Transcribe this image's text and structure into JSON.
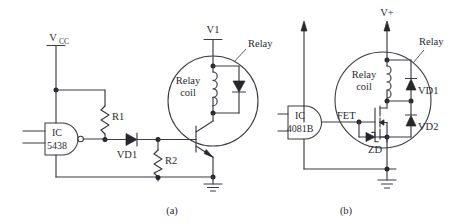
{
  "figure": {
    "background_color": "#ffffff",
    "line_color": "#3b3b42",
    "text_color": "#2a2a30"
  },
  "panels": [
    {
      "id": "a",
      "caption": "(a)",
      "supply_left": {
        "label_main": "V",
        "label_sub": "CC",
        "terminal_style": "bar"
      },
      "supply_right": {
        "label": "V1",
        "terminal_style": "bar"
      },
      "ic": {
        "name": "IC",
        "part": "5438",
        "gate_type": "nand",
        "inputs": 2,
        "inverted_output": true
      },
      "components": [
        {
          "ref": "R1",
          "type": "resistor",
          "label": "R1"
        },
        {
          "ref": "R2",
          "type": "resistor",
          "label": "R2"
        },
        {
          "ref": "VD1",
          "type": "diode",
          "label": "VD1"
        },
        {
          "ref": "Q1",
          "type": "transistor-npn",
          "label": ""
        },
        {
          "ref": "relay_coil",
          "type": "coil",
          "label_line1": "Relay",
          "label_line2": "coil"
        },
        {
          "ref": "flyback",
          "type": "diode",
          "label": ""
        }
      ],
      "annotations": [
        {
          "ref": "relay-callout",
          "label": "Relay"
        }
      ],
      "ground": {
        "label": ""
      }
    },
    {
      "id": "b",
      "caption": "(b)",
      "supply_left": {
        "label": "",
        "terminal_style": "arrow"
      },
      "supply_right": {
        "label": "V+",
        "terminal_style": "arrow"
      },
      "ic": {
        "name": "IC",
        "part": "4081B",
        "gate_type": "and",
        "inputs": 2,
        "inverted_output": false
      },
      "components": [
        {
          "ref": "FET",
          "type": "mosfet",
          "label": "FET"
        },
        {
          "ref": "ZD",
          "type": "zener",
          "label": "ZD"
        },
        {
          "ref": "VD1",
          "type": "diode",
          "label": "VD1"
        },
        {
          "ref": "VD2",
          "type": "diode",
          "label": "VD2"
        },
        {
          "ref": "relay_coil",
          "type": "coil",
          "label_line1": "Relay",
          "label_line2": "coil"
        }
      ],
      "annotations": [
        {
          "ref": "relay-callout",
          "label": "Relay"
        }
      ],
      "ground": {
        "label": ""
      }
    }
  ],
  "labels": {
    "a": {
      "vcc_main": "V",
      "vcc_sub": "CC",
      "v1": "V1",
      "ic_name": "IC",
      "ic_part": "5438",
      "r1": "R1",
      "r2": "R2",
      "vd1": "VD1",
      "relay_coil_1": "Relay",
      "relay_coil_2": "coil",
      "relay_callout": "Relay",
      "caption": "(a)"
    },
    "b": {
      "vplus": "V+",
      "ic_name": "IC",
      "ic_part": "4081B",
      "fet": "FET",
      "zd": "ZD",
      "vd1": "VD1",
      "vd2": "VD2",
      "relay_coil_1": "Relay",
      "relay_coil_2": "coil",
      "relay_callout": "Relay",
      "caption": "(b)"
    }
  }
}
